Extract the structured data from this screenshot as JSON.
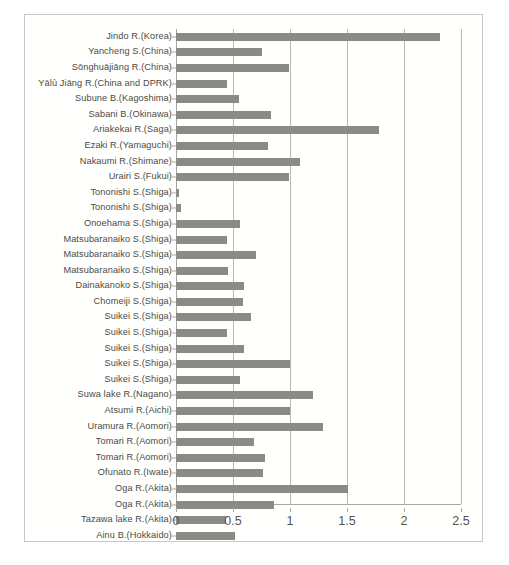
{
  "chart_data": {
    "type": "bar",
    "orientation": "horizontal",
    "title": "",
    "xlabel": "",
    "ylabel": "",
    "xlim": [
      0,
      2.5
    ],
    "xticks": [
      "0",
      "0.5",
      "1",
      "1.5",
      "2",
      "2.5"
    ],
    "xtick_values": [
      0,
      0.5,
      1,
      1.5,
      2,
      2.5
    ],
    "grid": "vertical",
    "legend": "none",
    "bar_color": "#8b8b86",
    "gridline_color": "#b9b9b3",
    "axis_color": "#a8a8a2",
    "label_color": "#4a4a46",
    "categories": [
      "Jindo R.(Korea)",
      "Yancheng S.(China)",
      "Sōnghuājiāng R.(China)",
      "Yālù Jiāng R.(China and DPRK)",
      "Subune B.(Kagoshima)",
      "Sabani B.(Okinawa)",
      "Ariakekai R.(Saga)",
      "Ezaki R.(Yamaguchi)",
      "Nakaumi R.(Shimane)",
      "Urairi S.(Fukui)",
      "Tononishi S.(Shiga)",
      "Tononishi S.(Shiga)",
      "Onoehama S.(Shiga)",
      "Matsubaranaiko S.(Shiga)",
      "Matsubaranaiko S.(Shiga)",
      "Matsubaranaiko S.(Shiga)",
      "Dainakanoko S.(Shiga)",
      "Chomeiji S.(Shiga)",
      "Suikei S.(Shiga)",
      "Suikei S.(Shiga)",
      "Suikei S.(Shiga)",
      "Suikei S.(Shiga)",
      "Suikei S.(Shiga)",
      "Suwa lake  R.(Nagano)",
      "Atsumi R.(Aichi)",
      "Uramura R.(Aomori)",
      "Tomari R.(Aomori)",
      "Tomari  R.(Aomori)",
      "Ofunato R.(Iwate)",
      "Oga R.(Akita)",
      "Oga R.(Akita)",
      "Tazawa lake  R.(Akita)",
      "Ainu B.(Hokkaido)"
    ],
    "values": [
      2.32,
      0.75,
      0.99,
      0.45,
      0.55,
      0.83,
      1.78,
      0.81,
      1.09,
      0.99,
      0.03,
      0.04,
      0.56,
      0.45,
      0.7,
      0.46,
      0.6,
      0.59,
      0.66,
      0.45,
      0.6,
      1.0,
      0.56,
      1.2,
      1.0,
      1.29,
      0.68,
      0.78,
      0.76,
      1.51,
      0.86,
      0.44,
      0.52
    ]
  }
}
